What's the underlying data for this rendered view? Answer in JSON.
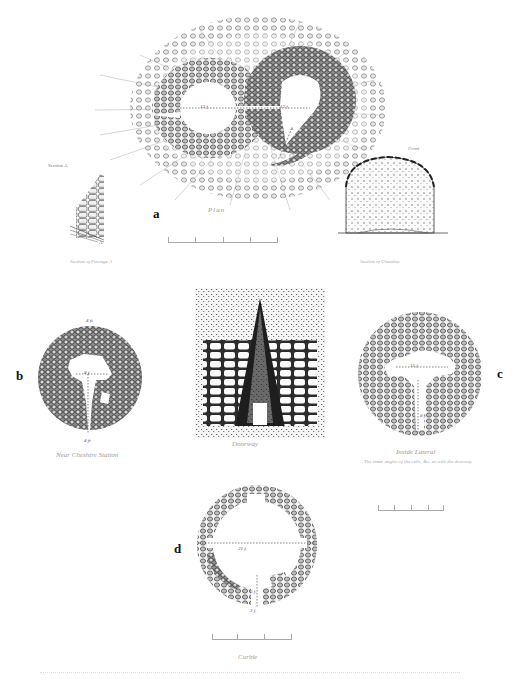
{
  "plate": {
    "background": "#ffffff",
    "ink_color": "#2a2a2a"
  },
  "figures": [
    {
      "id": "a",
      "panel_label": "a",
      "caption": "Plan",
      "description": "Double-chambered figure-of-eight structure with radiating stones",
      "measurements": [
        "12 f.",
        "12 f."
      ],
      "section_label": "A",
      "sub_figures": [
        {
          "label": "Section A",
          "caption": "Section of Passage A",
          "marker": "A"
        },
        {
          "label": "Front",
          "caption": "Section of Chamber"
        }
      ]
    },
    {
      "id": "b",
      "panel_label": "b",
      "caption": "Near Cheshire Station",
      "measurements": [
        "4 ft",
        "8 f.",
        "4 ft"
      ]
    },
    {
      "id": "doorway",
      "panel_label": "",
      "caption": "Doorway"
    },
    {
      "id": "c",
      "panel_label": "c",
      "caption": "Inside Lateral",
      "sub_caption": "The inner angles of the cells, &c. as with the doorway",
      "measurements": [
        "15 f.",
        "8 f."
      ]
    },
    {
      "id": "d",
      "panel_label": "d",
      "caption": "Curbie",
      "measurements": [
        "21 f.",
        "3 f.",
        "3 f."
      ]
    }
  ],
  "footer_text": ""
}
